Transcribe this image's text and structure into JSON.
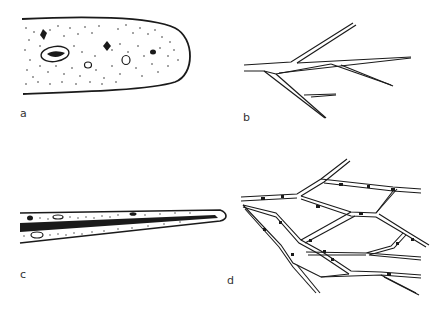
{
  "figure": {
    "panels": [
      {
        "id": "a",
        "label": "a",
        "description": "Rounded elongated tip with stippled interior, dark inclusions and small vacuoles"
      },
      {
        "id": "b",
        "label": "b",
        "description": "Branching double-line filament"
      },
      {
        "id": "c",
        "label": "c",
        "description": "Tapering structure with dark central strand and stippled margins"
      },
      {
        "id": "d",
        "label": "d",
        "description": "Anastomosing network of double-walled strands with granular contents"
      }
    ],
    "colors": {
      "ink": "#1a1a1a",
      "background": "#ffffff",
      "label": "#333333"
    }
  }
}
